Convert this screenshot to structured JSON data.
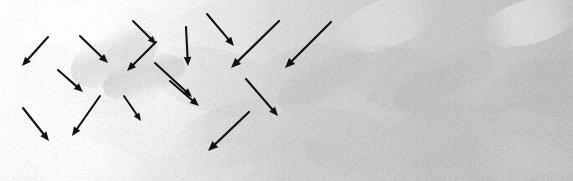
{
  "image": {
    "title": "Grayscale brush-textured field with motion arrows",
    "width": 573,
    "height": 181,
    "kind": "annotated-natural-image",
    "background_note": "painterly grayscale texture, bright near-white at upper-left fading to mid-gray toward right and bottom"
  },
  "palette": {
    "arrow_color": "#111111",
    "page_background": "#ffffff",
    "texture_light": "#fbfbfb",
    "texture_mid": "#c9c9c9",
    "texture_dark": "#a3a3a3",
    "texture_base": "#d6d6d6"
  },
  "texture": {
    "base_gradient": [
      {
        "stop": 0.0,
        "color": "#fcfcfc"
      },
      {
        "stop": 0.28,
        "color": "#ededed"
      },
      {
        "stop": 0.55,
        "color": "#d2d2d2"
      },
      {
        "stop": 0.8,
        "color": "#c4c4c4"
      },
      {
        "stop": 1.0,
        "color": "#bdbdbd"
      }
    ],
    "strokes": [
      {
        "x": 30,
        "y": 20,
        "w": 120,
        "h": 54,
        "rot": -22,
        "tone": 252,
        "alpha": 0.55
      },
      {
        "x": 8,
        "y": 4,
        "w": 150,
        "h": 40,
        "rot": -8,
        "tone": 255,
        "alpha": 0.7
      },
      {
        "x": 100,
        "y": 10,
        "w": 90,
        "h": 60,
        "rot": 18,
        "tone": 240,
        "alpha": 0.5
      },
      {
        "x": 160,
        "y": 0,
        "w": 120,
        "h": 50,
        "rot": -14,
        "tone": 226,
        "alpha": 0.45
      },
      {
        "x": 240,
        "y": 6,
        "w": 130,
        "h": 56,
        "rot": 12,
        "tone": 214,
        "alpha": 0.4
      },
      {
        "x": 330,
        "y": 0,
        "w": 110,
        "h": 48,
        "rot": -20,
        "tone": 236,
        "alpha": 0.42
      },
      {
        "x": 410,
        "y": 2,
        "w": 130,
        "h": 60,
        "rot": 10,
        "tone": 200,
        "alpha": 0.38
      },
      {
        "x": 480,
        "y": 0,
        "w": 100,
        "h": 44,
        "rot": -16,
        "tone": 244,
        "alpha": 0.5
      },
      {
        "x": 0,
        "y": 46,
        "w": 110,
        "h": 60,
        "rot": 16,
        "tone": 246,
        "alpha": 0.5
      },
      {
        "x": 60,
        "y": 52,
        "w": 120,
        "h": 62,
        "rot": -18,
        "tone": 232,
        "alpha": 0.45
      },
      {
        "x": 150,
        "y": 50,
        "w": 140,
        "h": 64,
        "rot": 14,
        "tone": 206,
        "alpha": 0.4
      },
      {
        "x": 250,
        "y": 44,
        "w": 130,
        "h": 58,
        "rot": -12,
        "tone": 196,
        "alpha": 0.38
      },
      {
        "x": 340,
        "y": 50,
        "w": 140,
        "h": 66,
        "rot": 18,
        "tone": 188,
        "alpha": 0.36
      },
      {
        "x": 440,
        "y": 46,
        "w": 130,
        "h": 58,
        "rot": -14,
        "tone": 204,
        "alpha": 0.36
      },
      {
        "x": 500,
        "y": 60,
        "w": 110,
        "h": 56,
        "rot": 12,
        "tone": 182,
        "alpha": 0.34
      },
      {
        "x": 0,
        "y": 100,
        "w": 120,
        "h": 62,
        "rot": -14,
        "tone": 250,
        "alpha": 0.55
      },
      {
        "x": 80,
        "y": 108,
        "w": 120,
        "h": 60,
        "rot": 16,
        "tone": 238,
        "alpha": 0.45
      },
      {
        "x": 170,
        "y": 102,
        "w": 140,
        "h": 64,
        "rot": -16,
        "tone": 200,
        "alpha": 0.38
      },
      {
        "x": 270,
        "y": 110,
        "w": 140,
        "h": 60,
        "rot": 14,
        "tone": 192,
        "alpha": 0.36
      },
      {
        "x": 370,
        "y": 104,
        "w": 140,
        "h": 66,
        "rot": -18,
        "tone": 186,
        "alpha": 0.34
      },
      {
        "x": 460,
        "y": 112,
        "w": 130,
        "h": 58,
        "rot": 12,
        "tone": 198,
        "alpha": 0.34
      },
      {
        "x": 20,
        "y": 140,
        "w": 130,
        "h": 50,
        "rot": 10,
        "tone": 252,
        "alpha": 0.6
      },
      {
        "x": 130,
        "y": 146,
        "w": 130,
        "h": 48,
        "rot": -12,
        "tone": 228,
        "alpha": 0.45
      },
      {
        "x": 250,
        "y": 142,
        "w": 140,
        "h": 52,
        "rot": 14,
        "tone": 196,
        "alpha": 0.35
      },
      {
        "x": 380,
        "y": 146,
        "w": 140,
        "h": 50,
        "rot": -12,
        "tone": 190,
        "alpha": 0.34
      },
      {
        "x": 470,
        "y": 140,
        "w": 120,
        "h": 52,
        "rot": 16,
        "tone": 206,
        "alpha": 0.34
      },
      {
        "x": 88,
        "y": 12,
        "w": 52,
        "h": 92,
        "rot": 66,
        "tone": 176,
        "alpha": 0.3
      },
      {
        "x": 124,
        "y": 34,
        "w": 40,
        "h": 86,
        "rot": 72,
        "tone": 168,
        "alpha": 0.32
      },
      {
        "x": 300,
        "y": 30,
        "w": 44,
        "h": 100,
        "rot": 60,
        "tone": 178,
        "alpha": 0.26
      },
      {
        "x": 420,
        "y": 26,
        "w": 48,
        "h": 110,
        "rot": 64,
        "tone": 172,
        "alpha": 0.24
      },
      {
        "x": 506,
        "y": 30,
        "w": 44,
        "h": 104,
        "rot": 58,
        "tone": 180,
        "alpha": 0.24
      }
    ]
  },
  "arrows": [
    {
      "id": "arrow-1",
      "x1": 48,
      "y1": 37,
      "x2": 22,
      "y2": 66,
      "width": 2.1,
      "head": 9
    },
    {
      "id": "arrow-2",
      "x1": 80,
      "y1": 36,
      "x2": 108,
      "y2": 63,
      "width": 2.1,
      "head": 9
    },
    {
      "id": "arrow-3",
      "x1": 58,
      "y1": 70,
      "x2": 83,
      "y2": 92,
      "width": 2.1,
      "head": 9
    },
    {
      "id": "arrow-4",
      "x1": 23,
      "y1": 108,
      "x2": 49,
      "y2": 141,
      "width": 2.1,
      "head": 9
    },
    {
      "id": "arrow-5",
      "x1": 100,
      "y1": 96,
      "x2": 72,
      "y2": 136,
      "width": 2.1,
      "head": 9
    },
    {
      "id": "arrow-6",
      "x1": 156,
      "y1": 42,
      "x2": 127,
      "y2": 71,
      "width": 2.1,
      "head": 9
    },
    {
      "id": "arrow-7",
      "x1": 133,
      "y1": 21,
      "x2": 156,
      "y2": 44,
      "width": 2.0,
      "head": 8
    },
    {
      "id": "arrow-8",
      "x1": 186,
      "y1": 27,
      "x2": 188,
      "y2": 66,
      "width": 2.1,
      "head": 9
    },
    {
      "id": "arrow-9",
      "x1": 155,
      "y1": 63,
      "x2": 192,
      "y2": 97,
      "width": 2.1,
      "head": 9
    },
    {
      "id": "arrow-10",
      "x1": 124,
      "y1": 96,
      "x2": 141,
      "y2": 121,
      "width": 2.0,
      "head": 8
    },
    {
      "id": "arrow-11",
      "x1": 207,
      "y1": 14,
      "x2": 234,
      "y2": 46,
      "width": 2.1,
      "head": 9
    },
    {
      "id": "arrow-12",
      "x1": 279,
      "y1": 21,
      "x2": 231,
      "y2": 68,
      "width": 2.2,
      "head": 10
    },
    {
      "id": "arrow-13",
      "x1": 170,
      "y1": 81,
      "x2": 199,
      "y2": 106,
      "width": 2.1,
      "head": 9
    },
    {
      "id": "arrow-14",
      "x1": 246,
      "y1": 79,
      "x2": 278,
      "y2": 116,
      "width": 2.1,
      "head": 9
    },
    {
      "id": "arrow-15",
      "x1": 249,
      "y1": 112,
      "x2": 208,
      "y2": 151,
      "width": 2.2,
      "head": 10
    },
    {
      "id": "arrow-16",
      "x1": 331,
      "y1": 22,
      "x2": 285,
      "y2": 68,
      "width": 2.2,
      "head": 10
    }
  ],
  "counts": {
    "arrow_total": 16
  }
}
